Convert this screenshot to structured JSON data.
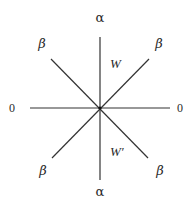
{
  "diagram": {
    "center": {
      "x": 100,
      "y": 108
    },
    "lines": [
      {
        "name": "vertical-axis",
        "x1": 100,
        "y1": 37,
        "x2": 100,
        "y2": 180
      },
      {
        "name": "horizontal-axis",
        "x1": 30,
        "y1": 108,
        "x2": 170,
        "y2": 108
      },
      {
        "name": "diagonal-nw-se",
        "x1": 51,
        "y1": 59,
        "x2": 148,
        "y2": 158
      },
      {
        "name": "diagonal-ne-sw",
        "x1": 149,
        "y1": 59,
        "x2": 52,
        "y2": 158
      }
    ],
    "labels": {
      "top": "α",
      "bottom": "α",
      "left": "0",
      "right": "0",
      "upper_left": "β",
      "upper_right": "β",
      "lower_left": "β",
      "lower_right": "β",
      "region_upper": "W",
      "region_lower": "W′"
    },
    "colors": {
      "line": "#333333",
      "text": "#2a2a2a",
      "background": "#ffffff"
    }
  }
}
